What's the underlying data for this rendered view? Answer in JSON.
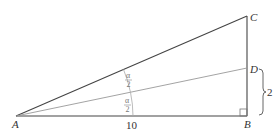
{
  "diagram": {
    "type": "right-triangle-angle-bisector",
    "points": {
      "A": {
        "label": "A"
      },
      "B": {
        "label": "B"
      },
      "C": {
        "label": "C"
      },
      "D": {
        "label": "D"
      }
    },
    "measurements": {
      "AB": "10",
      "BD": "2"
    },
    "angles": {
      "upper_half": {
        "numerator": "α",
        "denominator": "2"
      },
      "lower_half": {
        "numerator": "α",
        "denominator": "2"
      }
    },
    "right_angle_at": "B",
    "colors": {
      "main_lines": "#333333",
      "bisector_line": "#888888",
      "arc": "#999999"
    }
  }
}
